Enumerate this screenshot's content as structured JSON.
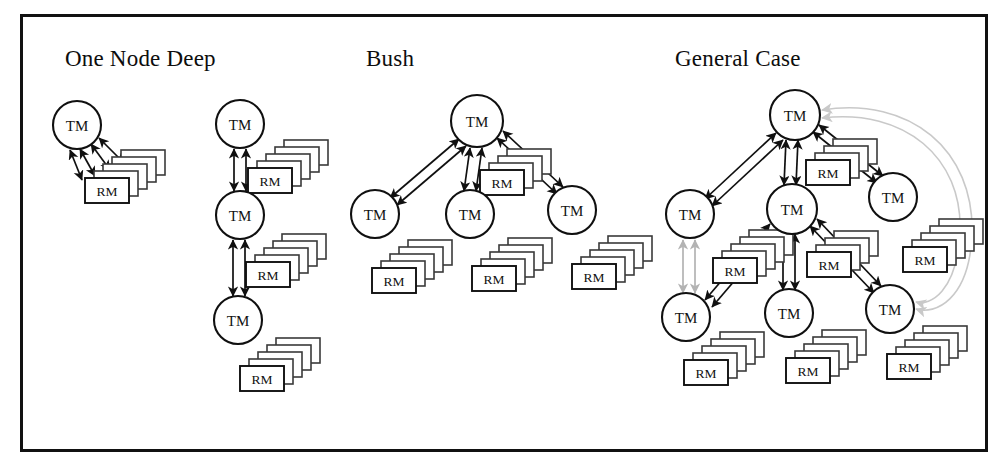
{
  "figure": {
    "kind": "diagram",
    "border_color": "#111111",
    "background": "#ffffff"
  },
  "sections": [
    {
      "id": "one-node-deep",
      "title": "One Node Deep",
      "title_x": 65,
      "title_y": 56
    },
    {
      "id": "bush",
      "title": "Bush",
      "title_x": 366,
      "title_y": 56
    },
    {
      "id": "general-case",
      "title": "General Case",
      "title_x": 675,
      "title_y": 56
    }
  ],
  "labels": {
    "tm": "TM",
    "rm": "RM"
  },
  "colors": {
    "stroke": "#101010",
    "gray_link": "#b3b3b3",
    "curve_link": "#c9c9c9",
    "node_fill": "#ffffff"
  },
  "nodes": [
    {
      "id": "ond-a-tm",
      "section": "one-node-deep",
      "label": "TM",
      "cx": 77,
      "cy": 125,
      "r": 24
    },
    {
      "id": "ond-b-tm1",
      "section": "one-node-deep",
      "label": "TM",
      "cx": 240,
      "cy": 124,
      "r": 24
    },
    {
      "id": "ond-b-tm2",
      "section": "one-node-deep",
      "label": "TM",
      "cx": 240,
      "cy": 215,
      "r": 24
    },
    {
      "id": "ond-b-tm3",
      "section": "one-node-deep",
      "label": "TM",
      "cx": 238,
      "cy": 320,
      "r": 24
    },
    {
      "id": "bush-top",
      "section": "bush",
      "label": "TM",
      "cx": 477,
      "cy": 121,
      "r": 26
    },
    {
      "id": "bush-l",
      "section": "bush",
      "label": "TM",
      "cx": 375,
      "cy": 214,
      "r": 24
    },
    {
      "id": "bush-c",
      "section": "bush",
      "label": "TM",
      "cx": 470,
      "cy": 214,
      "r": 24
    },
    {
      "id": "bush-r",
      "section": "bush",
      "label": "TM",
      "cx": 572,
      "cy": 210,
      "r": 24
    },
    {
      "id": "gc-top",
      "section": "general-case",
      "label": "TM",
      "cx": 795,
      "cy": 115,
      "r": 25
    },
    {
      "id": "gc-left",
      "section": "general-case",
      "label": "TM",
      "cx": 690,
      "cy": 214,
      "r": 24
    },
    {
      "id": "gc-mid",
      "section": "general-case",
      "label": "TM",
      "cx": 792,
      "cy": 209,
      "r": 25
    },
    {
      "id": "gc-right",
      "section": "general-case",
      "label": "TM",
      "cx": 893,
      "cy": 197,
      "r": 24
    },
    {
      "id": "gc-bl",
      "section": "general-case",
      "label": "TM",
      "cx": 686,
      "cy": 317,
      "r": 24
    },
    {
      "id": "gc-bc",
      "section": "general-case",
      "label": "TM",
      "cx": 789,
      "cy": 313,
      "r": 24
    },
    {
      "id": "gc-br",
      "section": "general-case",
      "label": "TM",
      "cx": 890,
      "cy": 309,
      "r": 24
    }
  ],
  "rm_stacks": [
    {
      "id": "ond-a-rm",
      "section": "one-node-deep",
      "label": "RM",
      "x": 85,
      "y": 178,
      "count": 5
    },
    {
      "id": "ond-b-rm1",
      "section": "one-node-deep",
      "label": "RM",
      "x": 248,
      "y": 168,
      "count": 5
    },
    {
      "id": "ond-b-rm2",
      "section": "one-node-deep",
      "label": "RM",
      "x": 246,
      "y": 262,
      "count": 5
    },
    {
      "id": "ond-b-rm3",
      "section": "one-node-deep",
      "label": "RM",
      "x": 240,
      "y": 366,
      "count": 5
    },
    {
      "id": "bush-top-rm",
      "section": "bush",
      "label": "RM",
      "x": 480,
      "y": 170,
      "count": 4
    },
    {
      "id": "bush-l-rm",
      "section": "bush",
      "label": "RM",
      "x": 372,
      "y": 268,
      "count": 5
    },
    {
      "id": "bush-c-rm",
      "section": "bush",
      "label": "RM",
      "x": 472,
      "y": 266,
      "count": 5
    },
    {
      "id": "bush-r-rm",
      "section": "bush",
      "label": "RM",
      "x": 572,
      "y": 264,
      "count": 5
    },
    {
      "id": "gc-top-rm",
      "section": "general-case",
      "label": "RM",
      "x": 806,
      "y": 160,
      "count": 4
    },
    {
      "id": "gc-left-rm",
      "section": "general-case",
      "label": "RM",
      "x": 713,
      "y": 258,
      "count": 5
    },
    {
      "id": "gc-mid-rm",
      "section": "general-case",
      "label": "RM",
      "x": 807,
      "y": 252,
      "count": 4
    },
    {
      "id": "gc-rt-rm",
      "section": "general-case",
      "label": "RM",
      "x": 903,
      "y": 247,
      "count": 5
    },
    {
      "id": "gc-bl-rm",
      "section": "general-case",
      "label": "RM",
      "x": 684,
      "y": 360,
      "count": 5
    },
    {
      "id": "gc-bc-rm",
      "section": "general-case",
      "label": "RM",
      "x": 786,
      "y": 358,
      "count": 5
    },
    {
      "id": "gc-br-rm",
      "section": "general-case",
      "label": "RM",
      "x": 887,
      "y": 354,
      "count": 5
    }
  ],
  "links": [
    {
      "id": "ond-a-1",
      "from": [
        91,
        144
      ],
      "to": [
        110,
        170
      ],
      "style": "double",
      "color": "#101010"
    },
    {
      "id": "ond-a-2",
      "from": [
        80,
        149
      ],
      "to": [
        95,
        176
      ],
      "style": "double",
      "color": "#101010"
    },
    {
      "id": "ond-a-3",
      "from": [
        99,
        138
      ],
      "to": [
        124,
        163
      ],
      "style": "double",
      "color": "#101010"
    },
    {
      "id": "ond-a-4",
      "from": [
        70,
        150
      ],
      "to": [
        82,
        180
      ],
      "style": "double",
      "color": "#101010"
    },
    {
      "id": "ond-b-v1a",
      "from": [
        234,
        149
      ],
      "to": [
        234,
        191
      ],
      "style": "double",
      "color": "#101010"
    },
    {
      "id": "ond-b-v1b",
      "from": [
        246,
        149
      ],
      "to": [
        246,
        191
      ],
      "style": "double",
      "color": "#101010"
    },
    {
      "id": "ond-b-v2a",
      "from": [
        233,
        240
      ],
      "to": [
        233,
        296
      ],
      "style": "double",
      "color": "#101010"
    },
    {
      "id": "ond-b-v2b",
      "from": [
        245,
        240
      ],
      "to": [
        245,
        296
      ],
      "style": "double",
      "color": "#101010"
    },
    {
      "id": "bush-tl-a",
      "from": [
        459,
        139
      ],
      "to": [
        390,
        198
      ],
      "style": "double",
      "color": "#101010"
    },
    {
      "id": "bush-tl-b",
      "from": [
        466,
        146
      ],
      "to": [
        397,
        205
      ],
      "style": "double",
      "color": "#101010"
    },
    {
      "id": "bush-tc-a",
      "from": [
        470,
        148
      ],
      "to": [
        464,
        191
      ],
      "style": "double",
      "color": "#101010"
    },
    {
      "id": "bush-tc-b",
      "from": [
        482,
        148
      ],
      "to": [
        476,
        191
      ],
      "style": "double",
      "color": "#101010"
    },
    {
      "id": "bush-tr-a",
      "from": [
        497,
        138
      ],
      "to": [
        557,
        194
      ],
      "style": "double",
      "color": "#101010"
    },
    {
      "id": "bush-tr-b",
      "from": [
        503,
        131
      ],
      "to": [
        563,
        187
      ],
      "style": "double",
      "color": "#101010"
    },
    {
      "id": "gc-tl-a",
      "from": [
        776,
        133
      ],
      "to": [
        705,
        199
      ],
      "style": "double",
      "color": "#101010"
    },
    {
      "id": "gc-tl-b",
      "from": [
        783,
        140
      ],
      "to": [
        712,
        206
      ],
      "style": "double",
      "color": "#101010"
    },
    {
      "id": "gc-tc-a",
      "from": [
        786,
        140
      ],
      "to": [
        784,
        185
      ],
      "style": "double",
      "color": "#101010"
    },
    {
      "id": "gc-tc-b",
      "from": [
        798,
        140
      ],
      "to": [
        796,
        185
      ],
      "style": "double",
      "color": "#101010"
    },
    {
      "id": "gc-tr-a",
      "from": [
        813,
        132
      ],
      "to": [
        877,
        183
      ],
      "style": "double",
      "color": "#101010"
    },
    {
      "id": "gc-tr-b",
      "from": [
        819,
        125
      ],
      "to": [
        883,
        176
      ],
      "style": "double",
      "color": "#101010"
    },
    {
      "id": "gc-ml-a",
      "from": [
        770,
        224
      ],
      "to": [
        705,
        300
      ],
      "style": "double",
      "color": "#101010"
    },
    {
      "id": "gc-ml-b",
      "from": [
        777,
        231
      ],
      "to": [
        712,
        307
      ],
      "style": "double",
      "color": "#101010"
    },
    {
      "id": "gc-mc-a",
      "from": [
        783,
        234
      ],
      "to": [
        783,
        290
      ],
      "style": "double",
      "color": "#101010"
    },
    {
      "id": "gc-mc-b",
      "from": [
        795,
        234
      ],
      "to": [
        795,
        290
      ],
      "style": "double",
      "color": "#101010"
    },
    {
      "id": "gc-mr-a",
      "from": [
        810,
        226
      ],
      "to": [
        874,
        293
      ],
      "style": "double",
      "color": "#101010"
    },
    {
      "id": "gc-mr-b",
      "from": [
        817,
        219
      ],
      "to": [
        881,
        286
      ],
      "style": "double",
      "color": "#101010"
    },
    {
      "id": "gc-gray-a",
      "from": [
        683,
        240
      ],
      "to": [
        683,
        293
      ],
      "style": "double",
      "color": "#b3b3b3"
    },
    {
      "id": "gc-gray-b",
      "from": [
        695,
        240
      ],
      "to": [
        695,
        293
      ],
      "style": "double",
      "color": "#b3b3b3"
    }
  ],
  "curved_links": [
    {
      "id": "gc-feedback-outer",
      "path": "M 822 110 C 910 96, 975 150, 972 235 C 969 300, 935 315, 916 309",
      "color": "#c9c9c9"
    },
    {
      "id": "gc-feedback-inner",
      "path": "M 822 118 C 905 108, 963 158, 960 232 C 957 292, 930 306, 916 302",
      "color": "#c9c9c9"
    }
  ]
}
